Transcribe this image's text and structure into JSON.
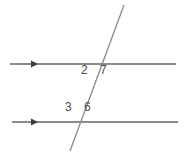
{
  "figure": {
    "background_color": "#ffffff",
    "line_color": "#8c8c8c",
    "transversal_color": "#8a8a8a",
    "label_color": "#4a4a4a",
    "width": 187,
    "height": 156
  },
  "lines": {
    "top_parallel": {
      "name": "top parallel line",
      "x1": 10,
      "y1": 64,
      "x2": 176,
      "y2": 64,
      "stroke_width": 1.4,
      "arrow": {
        "name": "right-arrow",
        "x": 33,
        "y": 64,
        "direction": "right",
        "size": 5
      }
    },
    "bottom_parallel": {
      "name": "bottom parallel line",
      "x1": 12,
      "y1": 122,
      "x2": 178,
      "y2": 122,
      "stroke_width": 1.4,
      "arrow": {
        "name": "right-arrow",
        "x": 33,
        "y": 122,
        "direction": "right",
        "size": 5
      }
    },
    "transversal": {
      "name": "transversal line",
      "x1": 124,
      "y1": 5,
      "x2": 70,
      "y2": 151,
      "stroke_width": 1.3
    }
  },
  "intersections": {
    "upper": {
      "x": 97,
      "y": 64
    },
    "lower": {
      "x": 76,
      "y": 122
    }
  },
  "labels": [
    {
      "id": "label-2",
      "text": "2",
      "x": 81,
      "y": 64,
      "position": "upper-left"
    },
    {
      "id": "label-7",
      "text": "7",
      "x": 100,
      "y": 64,
      "position": "upper-right"
    },
    {
      "id": "label-3",
      "text": "3",
      "x": 65,
      "y": 101,
      "position": "lower-left"
    },
    {
      "id": "label-6",
      "text": "6",
      "x": 84,
      "y": 101,
      "position": "lower-right"
    }
  ]
}
